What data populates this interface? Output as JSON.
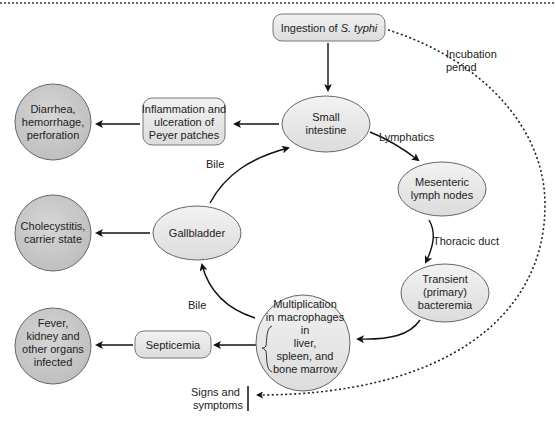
{
  "colors": {
    "circle_fill": "#c8c8c8",
    "ellipse_fill": "#e6e6e6",
    "stroke": "#555555",
    "arrow": "#111111",
    "text": "#222222"
  },
  "nodes": {
    "ingestion": {
      "pre": "Ingestion of ",
      "italic": "S. typhi"
    },
    "small_intestine": {
      "lines": [
        "Small",
        "intestine"
      ]
    },
    "inflammation": {
      "lines": [
        "Inflammation and",
        "ulceration of",
        "Peyer patches"
      ]
    },
    "diarrhea": {
      "lines": [
        "Diarrhea,",
        "hemorrhage,",
        "perforation"
      ]
    },
    "mesenteric": {
      "lines": [
        "Mesenteric",
        "lymph nodes"
      ]
    },
    "transient": {
      "lines": [
        "Transient",
        "(primary)",
        "bacteremia"
      ]
    },
    "multiplication": {
      "lines": [
        "Multiplication",
        "in macrophages",
        "in",
        "liver,",
        "spleen, and",
        "bone marrow"
      ]
    },
    "gallbladder": {
      "lines": [
        "Gallbladder"
      ]
    },
    "cholecystitis": {
      "lines": [
        "Cholecystitis,",
        "carrier state"
      ]
    },
    "septicemia": {
      "lines": [
        "Septicemia"
      ]
    },
    "fever": {
      "lines": [
        "Fever,",
        "kidney and",
        "other organs",
        "infected"
      ]
    }
  },
  "edge_labels": {
    "lymphatics": "Lymphatics",
    "thoracic_duct": "Thoracic duct",
    "bile_upper": "Bile",
    "bile_lower": "Bile",
    "incubation": [
      "Incubation",
      "period"
    ],
    "signs": [
      "Signs and",
      "symptoms"
    ]
  }
}
